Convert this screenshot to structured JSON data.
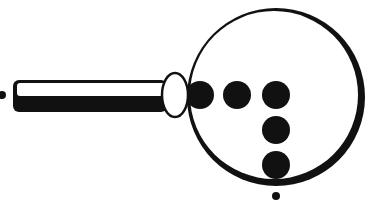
{
  "figure": {
    "colors": {
      "ink": "#111111",
      "background": "#ffffff"
    },
    "lens": {
      "cx": 276,
      "cy": 97,
      "r": 87
    },
    "handle": {
      "x": 14,
      "y": 81,
      "w": 152,
      "h": 30
    },
    "collar": {
      "cx": 175,
      "cy": 95,
      "rx": 13,
      "ry": 22
    },
    "end_dot": {
      "cx": 2,
      "cy": 95,
      "r": 4
    },
    "dots": [
      {
        "cx": 200,
        "cy": 95,
        "r": 14
      },
      {
        "cx": 237,
        "cy": 95,
        "r": 14
      },
      {
        "cx": 276,
        "cy": 95,
        "r": 14
      },
      {
        "cx": 276,
        "cy": 130,
        "r": 14
      },
      {
        "cx": 276,
        "cy": 165,
        "r": 14
      }
    ],
    "bottom_dot": {
      "cx": 276,
      "cy": 196,
      "r": 4
    }
  }
}
